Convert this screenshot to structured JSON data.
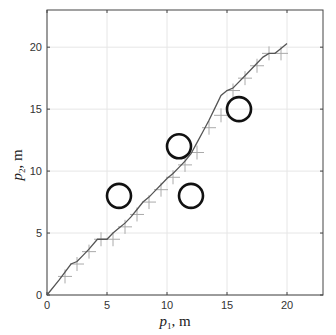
{
  "chart_data": {
    "type": "line",
    "title": "",
    "xlabel": "p1, m",
    "ylabel": "p2, m",
    "xlabel_main": "p",
    "xlabel_sub": "1",
    "xlabel_unit": ", m",
    "ylabel_main": "p",
    "ylabel_sub": "2",
    "ylabel_unit": ", m",
    "xlim": [
      0,
      23
    ],
    "ylim": [
      0,
      23
    ],
    "xticks": [
      0,
      5,
      10,
      15,
      20
    ],
    "yticks": [
      0,
      5,
      10,
      15,
      20
    ],
    "grid": true,
    "legend": null,
    "series": [
      {
        "name": "trajectory",
        "style": "line",
        "color": "#555555",
        "x": [
          0,
          1,
          2,
          2.5,
          3,
          3.5,
          4.2,
          5,
          5.5,
          6,
          6.5,
          7,
          7.5,
          8,
          8.5,
          9,
          9.5,
          10,
          10.5,
          11,
          11.5,
          12,
          12.5,
          13,
          13.5,
          14,
          14.5,
          15,
          15.5,
          16,
          16.5,
          17,
          17.5,
          18,
          18.5,
          19,
          19.5,
          20
        ],
        "y": [
          0,
          1.2,
          2.5,
          2.7,
          3.2,
          3.7,
          4.5,
          4.5,
          5,
          5.4,
          5.8,
          6.3,
          6.9,
          7.5,
          7.9,
          8.4,
          8.9,
          9.4,
          9.8,
          10.3,
          10.8,
          11.4,
          12.3,
          13.2,
          14.1,
          15.1,
          16.1,
          16.5,
          16.7,
          17.2,
          17.7,
          18.2,
          18.7,
          19.2,
          19.5,
          19.5,
          19.9,
          20.3
        ]
      },
      {
        "name": "waypoints",
        "style": "plus-marker",
        "color": "#aaaaaa",
        "x": [
          1.5,
          2.5,
          3.5,
          4.5,
          5.5,
          6.5,
          7.5,
          8.5,
          9.5,
          10.5,
          11.5,
          12.5,
          13.5,
          14.5,
          15.5,
          16.5,
          17.5,
          18.5,
          19.5
        ],
        "y": [
          1.5,
          2.5,
          3.5,
          4.5,
          4.5,
          5.5,
          6.5,
          7.5,
          8.5,
          9.5,
          10.5,
          11.5,
          13.5,
          14.5,
          16.5,
          17.5,
          18.5,
          19.5,
          19.5
        ]
      },
      {
        "name": "obstacles",
        "style": "circle",
        "color": "#111111",
        "radius": 1,
        "x": [
          6,
          11,
          12,
          16
        ],
        "y": [
          8,
          12,
          8,
          15
        ]
      }
    ]
  }
}
